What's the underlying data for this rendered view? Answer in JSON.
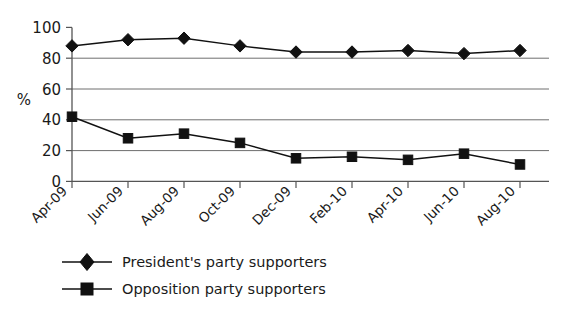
{
  "chart_data": {
    "type": "line",
    "title": "",
    "xlabel": "",
    "ylabel": "%",
    "ylim": [
      0,
      100
    ],
    "yticks": [
      0,
      20,
      40,
      60,
      80,
      100
    ],
    "grid": "horizontal",
    "legend_position": "bottom-left",
    "categories": [
      "Apr-09",
      "Jun-09",
      "Aug-09",
      "Oct-09",
      "Dec-09",
      "Feb-10",
      "Apr-10",
      "Jun-10",
      "Aug-10"
    ],
    "series": [
      {
        "name": "President's party supporters",
        "marker": "diamond",
        "color": "#111111",
        "values": [
          88,
          92,
          93,
          88,
          84,
          84,
          85,
          83,
          85
        ]
      },
      {
        "name": "Opposition party supporters",
        "marker": "square",
        "color": "#111111",
        "values": [
          42,
          28,
          31,
          25,
          15,
          16,
          14,
          18,
          11
        ]
      }
    ]
  },
  "yaxis": {
    "label": "%",
    "tick_labels": [
      "100",
      "80",
      "60",
      "40",
      "20",
      "0"
    ]
  },
  "xaxis": {
    "tick_labels": [
      "Apr-09",
      "Jun-09",
      "Aug-09",
      "Oct-09",
      "Dec-09",
      "Feb-10",
      "Apr-10",
      "Jun-10",
      "Aug-10"
    ]
  },
  "legend": {
    "items": [
      {
        "label": "President's party supporters",
        "marker": "diamond-marker"
      },
      {
        "label": "Opposition party supporters",
        "marker": "square-marker"
      }
    ]
  }
}
